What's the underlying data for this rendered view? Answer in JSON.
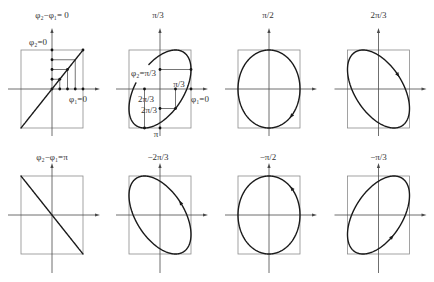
{
  "figure": {
    "colors": {
      "curve": "#1a1a1a",
      "box": "#8c8c8c",
      "axis": "#4a4a4a",
      "text": "#333333"
    },
    "panels": [
      {
        "title": "φ₂−φ₁= 0",
        "phase_difference_over_pi": 0,
        "labels": {
          "phi2_zero": "φ₂=0",
          "phi1_zero": "φ₁=0"
        }
      },
      {
        "title": "π/3",
        "phase_difference_over_pi": 0.33333,
        "labels": {
          "phi2_start": "φ₂=π/3",
          "x_pi_over_3": "π/3",
          "phi1_zero": "φ₁=0",
          "x_2pi_over_3": "2π/3",
          "y_2pi_over_3": "2π/3",
          "y_pi": "π"
        }
      },
      {
        "title": "π/2",
        "phase_difference_over_pi": 0.5
      },
      {
        "title": "2π/3",
        "phase_difference_over_pi": 0.66667
      },
      {
        "title": "φ₂−φ₁=π",
        "phase_difference_over_pi": 1
      },
      {
        "title": "−2π/3",
        "phase_difference_over_pi": -0.66667
      },
      {
        "title": "−π/2",
        "phase_difference_over_pi": -0.5
      },
      {
        "title": "−π/3",
        "phase_difference_over_pi": -0.33333
      }
    ]
  }
}
